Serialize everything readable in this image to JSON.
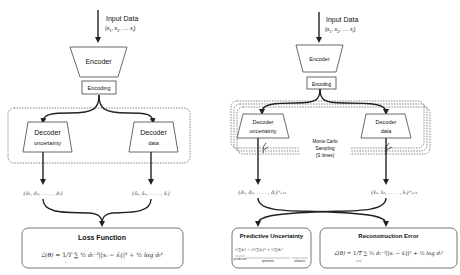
{
  "left_panel": {
    "input_label": "Input Data",
    "input_set": "{x1, x2, .... xt}",
    "encoder_label": "Encoder",
    "encoding_label": "Encoding",
    "decoder_uncertainty_line1": "Decoder",
    "decoder_uncertainty_line2": "uncertainty",
    "decoder_data_line1": "Decoder",
    "decoder_data_line2": "data",
    "sigma_set": "{σ̂₁, σ̂₂, . . . . , σ̂ₜ}",
    "xhat_set": "{x̂₁, x̂₂, . . . . , x̂ₜ}",
    "loss_title": "Loss Function",
    "loss_formula": "ℒ(θ) = 1/T Σᵢ ½ σ̂ᵢ⁻² ||xᵢ − x̂ᵢ||² + ½ log σ̂ᵢ²"
  },
  "right_panel": {
    "input_label": "Input Data",
    "input_set": "{x1, x2, .... xt}",
    "encoder_label": "Encoder",
    "encoding_label": "Encoding",
    "decoder_uncertainty_line1": "Decoder",
    "decoder_uncertainty_line2": "uncertainty",
    "decoder_data_line1": "Decoder",
    "decoder_data_line2": "data",
    "mc_line1": "Monte Carlo",
    "mc_line2": "Sampling",
    "mc_line3": "(S times)",
    "sigma_set": "{σ̂₁, σ̂₂, . . . . , σ̂ₜ}ᴺₛ₌₁",
    "xhat_set": "{x̂₁, x̂₂, . . . . , x̂ₜ}ᴺₛ₌₁",
    "predictive_title": "Predictive Uncertainty",
    "predictive_formula": "1/S Σ x̂ₛ² − (1/S Σ x̂ₛ)² + 1/S Σ σ̂ₛ²",
    "predictive_underbrace_1": "Var(xₜ)",
    "predictive_underbrace_2": "epistemic",
    "predictive_underbrace_3": "aleatoric",
    "predictive_prefix_label": "predictive",
    "reconstruction_title": "Reconstruction Error",
    "reconstruction_formula": "ℒ(θ) = 1/T Σᵢ₌₁ ½ σ̂ᵢ⁻² ||xᵢ − x̂ᵢ||² + ½ log σ̂ᵢ²"
  }
}
